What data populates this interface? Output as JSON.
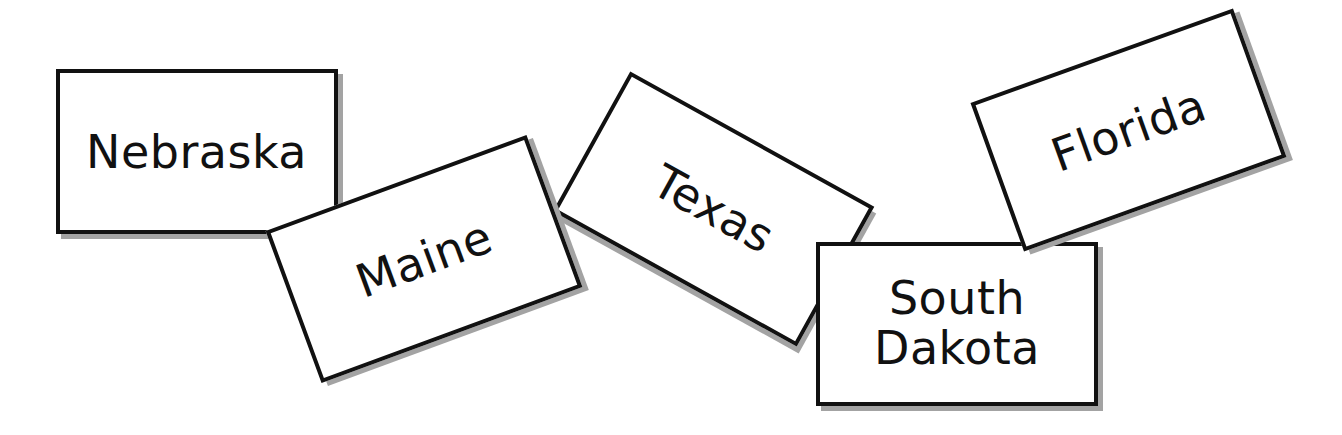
{
  "scene": {
    "description": "Scattered state-name word cards",
    "background": "#ffffff",
    "card_border_color": "#111111",
    "card_shadow_color": "#a3a3a3"
  },
  "cards": [
    {
      "id": "nebraska",
      "lines": [
        "Nebraska"
      ],
      "center_x": 196.5,
      "center_y": 151.5,
      "width": 282,
      "height": 165,
      "rotation_deg": 0,
      "z": 1
    },
    {
      "id": "texas",
      "lines": [
        "Texas"
      ],
      "center_x": 713,
      "center_y": 209,
      "width": 279,
      "height": 160,
      "rotation_deg": 29,
      "z": 2
    },
    {
      "id": "maine",
      "lines": [
        "Maine"
      ],
      "center_x": 424,
      "center_y": 259,
      "width": 278,
      "height": 162,
      "rotation_deg": -20.2,
      "z": 3
    },
    {
      "id": "south-dakota",
      "lines": [
        "South",
        "Dakota"
      ],
      "center_x": 957,
      "center_y": 323.5,
      "width": 282,
      "height": 164,
      "rotation_deg": 0,
      "z": 4
    },
    {
      "id": "florida",
      "lines": [
        "Florida"
      ],
      "center_x": 1128,
      "center_y": 130,
      "width": 279,
      "height": 158,
      "rotation_deg": -19.8,
      "z": 5
    }
  ]
}
